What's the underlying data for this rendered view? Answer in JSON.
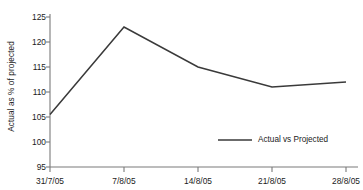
{
  "chart_data": {
    "type": "line",
    "title": "",
    "xlabel": "",
    "ylabel": "Actual as % of projected",
    "categories": [
      "31/7/05",
      "7/8/05",
      "14/8/05",
      "21/8/05",
      "28/8/05"
    ],
    "series": [
      {
        "name": "Actual vs Projected",
        "values": [
          105.5,
          123.0,
          115.0,
          111.0,
          112.0
        ],
        "color": "#3a3a3a"
      }
    ],
    "ylim": [
      95,
      125
    ],
    "yticks": [
      95,
      100,
      105,
      110,
      115,
      120,
      125
    ],
    "ytick_labels": [
      "95",
      "100",
      "105",
      "110",
      "115",
      "120",
      "125"
    ],
    "grid": false,
    "legend": {
      "position": "inside-lower-right",
      "entries": [
        {
          "label": "Actual vs Projected",
          "marker": "line",
          "color": "#3a3a3a"
        }
      ]
    },
    "axes": {
      "left_spine": true,
      "bottom_spine": true,
      "top_spine": false,
      "right_spine": false,
      "tick_direction": "out",
      "spine_color": "#7a7a7a"
    },
    "background_color": "#ffffff"
  }
}
